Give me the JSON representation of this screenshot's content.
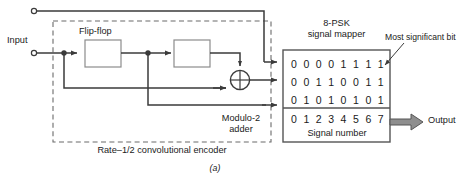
{
  "figure": {
    "caption": "(a)",
    "input_label": "Input",
    "output_label": "Output",
    "flipflop_label": "Flip-flop",
    "adder_label_line1": "Modulo-2",
    "adder_label_line2": "adder",
    "encoder_label": "Rate–1/2 convolutional encoder",
    "mapper_label_line1": "8-PSK",
    "mapper_label_line2": "signal mapper",
    "msb_label": "Most significant bit",
    "signal_number_label": "Signal number"
  },
  "chart_data": {
    "type": "table",
    "title": "8-PSK signal mapper",
    "columns": [
      "0",
      "1",
      "2",
      "3",
      "4",
      "5",
      "6",
      "7"
    ],
    "column_header_label": "Signal number",
    "rows": [
      {
        "name": "most-significant-bit",
        "values": [
          "0",
          "0",
          "0",
          "0",
          "1",
          "1",
          "1",
          "1"
        ]
      },
      {
        "name": "middle-bit",
        "values": [
          "0",
          "0",
          "1",
          "1",
          "0",
          "0",
          "1",
          "1"
        ]
      },
      {
        "name": "least-significant-bit",
        "values": [
          "0",
          "1",
          "0",
          "1",
          "0",
          "1",
          "0",
          "1"
        ]
      }
    ],
    "annotations": [
      "Most significant bit"
    ]
  },
  "colors": {
    "line": "#3b3b3b",
    "box_stroke": "#8c8c8c",
    "dashed": "#6b6b6b",
    "arrow_fill": "#8e8e8e",
    "text": "#1a1a1a"
  }
}
